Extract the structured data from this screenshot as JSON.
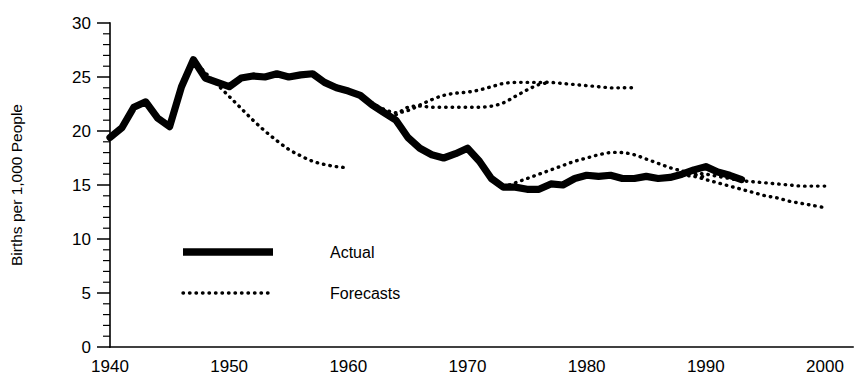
{
  "chart_data": {
    "type": "line",
    "title": "",
    "xlabel": "",
    "ylabel": "Births per 1,000 People",
    "xlim": [
      1940,
      2000
    ],
    "ylim": [
      0,
      30
    ],
    "grid": false,
    "legend_position": "inside-lower-left",
    "x_ticks": [
      "1940",
      "1950",
      "1960",
      "1970",
      "1980",
      "1990",
      "2000"
    ],
    "x_tick_values": [
      1940,
      1950,
      1960,
      1970,
      1980,
      1990,
      2000
    ],
    "y_ticks": [
      "0",
      "5",
      "10",
      "15",
      "20",
      "25",
      "30"
    ],
    "y_tick_values": [
      0,
      5,
      10,
      15,
      20,
      25,
      30
    ],
    "y_minor_tick_step": 1,
    "series": [
      {
        "name": "Actual",
        "style": "thick-solid",
        "color": "#000000",
        "x": [
          1940,
          1941,
          1942,
          1943,
          1944,
          1945,
          1946,
          1947,
          1948,
          1949,
          1950,
          1951,
          1952,
          1953,
          1954,
          1955,
          1956,
          1957,
          1958,
          1959,
          1960,
          1961,
          1962,
          1963,
          1964,
          1965,
          1966,
          1967,
          1968,
          1969,
          1970,
          1971,
          1972,
          1973,
          1974,
          1975,
          1976,
          1977,
          1978,
          1979,
          1980,
          1981,
          1982,
          1983,
          1984,
          1985,
          1986,
          1987,
          1988,
          1989,
          1990,
          1991,
          1992,
          1993
        ],
        "values": [
          19.4,
          20.3,
          22.2,
          22.7,
          21.2,
          20.4,
          24.1,
          26.6,
          24.9,
          24.5,
          24.1,
          24.9,
          25.1,
          25.0,
          25.3,
          25.0,
          25.2,
          25.3,
          24.5,
          24.0,
          23.7,
          23.3,
          22.4,
          21.7,
          21.0,
          19.4,
          18.4,
          17.8,
          17.5,
          17.9,
          18.4,
          17.2,
          15.6,
          14.8,
          14.8,
          14.6,
          14.6,
          15.1,
          15.0,
          15.6,
          15.9,
          15.8,
          15.9,
          15.6,
          15.6,
          15.8,
          15.6,
          15.7,
          16.0,
          16.4,
          16.7,
          16.2,
          15.9,
          15.5
        ]
      },
      {
        "name": "Forecasts",
        "label": "forecast-1947-declining",
        "style": "dotted",
        "color": "#000000",
        "x": [
          1947,
          1948,
          1949,
          1950,
          1951,
          1952,
          1953,
          1954,
          1955,
          1956,
          1957,
          1958,
          1959,
          1960
        ],
        "values": [
          26.6,
          25.4,
          24.3,
          23.2,
          22.1,
          21.0,
          20.0,
          19.1,
          18.3,
          17.7,
          17.2,
          16.9,
          16.7,
          16.6
        ]
      },
      {
        "name": "Forecasts",
        "label": "forecast-1955-tracking-actual",
        "style": "dotted",
        "color": "#000000",
        "x": [
          1955,
          1956,
          1957,
          1958,
          1959,
          1960,
          1961,
          1962,
          1963,
          1964,
          1965,
          1966,
          1967,
          1968,
          1969,
          1970,
          1971,
          1972,
          1973,
          1974,
          1975,
          1976,
          1977,
          1978,
          1979,
          1980,
          1981,
          1982,
          1983,
          1984
        ],
        "values": [
          25.0,
          25.2,
          25.4,
          24.6,
          24.1,
          23.7,
          23.3,
          22.6,
          22.0,
          21.7,
          21.9,
          22.4,
          22.9,
          23.3,
          23.5,
          23.6,
          23.8,
          24.1,
          24.4,
          24.5,
          24.5,
          24.5,
          24.5,
          24.4,
          24.3,
          24.2,
          24.1,
          24.0,
          24.0,
          24.0
        ]
      },
      {
        "name": "Forecasts",
        "label": "forecast-1964-flat-then-rising",
        "style": "dotted",
        "color": "#000000",
        "x": [
          1964,
          1965,
          1966,
          1967,
          1968,
          1969,
          1970,
          1971,
          1972,
          1973,
          1974,
          1975,
          1976,
          1977
        ],
        "values": [
          21.5,
          22.2,
          22.3,
          22.2,
          22.2,
          22.2,
          22.2,
          22.2,
          22.3,
          22.6,
          23.2,
          23.8,
          24.3,
          24.5
        ]
      },
      {
        "name": "Forecasts",
        "label": "forecast-1973-rising-to-18",
        "style": "dotted",
        "color": "#000000",
        "x": [
          1973,
          1974,
          1975,
          1976,
          1977,
          1978,
          1979,
          1980,
          1981,
          1982,
          1983,
          1984,
          1985,
          1986,
          1987,
          1988,
          1989,
          1990
        ],
        "values": [
          14.8,
          15.2,
          15.6,
          16.0,
          16.4,
          16.8,
          17.2,
          17.5,
          17.8,
          18.0,
          18.0,
          17.8,
          17.4,
          17.0,
          16.6,
          16.3,
          16.0,
          15.7
        ]
      },
      {
        "name": "Forecasts",
        "label": "forecast-1988-flat-15",
        "style": "dotted",
        "color": "#000000",
        "x": [
          1988,
          1989,
          1990,
          1991,
          1992,
          1993,
          1994,
          1995,
          1996,
          1997,
          1998,
          1999,
          2000
        ],
        "values": [
          16.0,
          16.1,
          16.0,
          15.8,
          15.6,
          15.4,
          15.3,
          15.2,
          15.1,
          15.0,
          14.9,
          14.9,
          14.9
        ]
      },
      {
        "name": "Forecasts",
        "label": "forecast-1988-declining-13",
        "style": "dotted",
        "color": "#000000",
        "x": [
          1988,
          1989,
          1990,
          1991,
          1992,
          1993,
          1994,
          1995,
          1996,
          1997,
          1998,
          1999,
          2000
        ],
        "values": [
          15.9,
          15.8,
          15.5,
          15.2,
          14.9,
          14.6,
          14.3,
          14.0,
          13.8,
          13.5,
          13.3,
          13.1,
          12.9
        ]
      }
    ],
    "legend": [
      {
        "label": "Actual",
        "style": "thick-solid"
      },
      {
        "label": "Forecasts",
        "style": "dotted"
      }
    ]
  }
}
